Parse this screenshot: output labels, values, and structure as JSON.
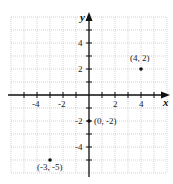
{
  "chart_data": {
    "type": "scatter",
    "title": "",
    "xlabel": "x",
    "ylabel": "y",
    "xlim": [
      -6,
      6
    ],
    "ylim": [
      -6,
      6
    ],
    "grid": true,
    "x_ticks": [
      -4,
      -2,
      2,
      4
    ],
    "y_ticks": [
      4,
      2,
      -2,
      -4
    ],
    "x_tick_labels": [
      "-4",
      "-2",
      "2",
      "4"
    ],
    "y_tick_labels": [
      "4",
      "2",
      "-2",
      "-4"
    ],
    "points": [
      {
        "x": 4,
        "y": 2,
        "label": "(4, 2)"
      },
      {
        "x": 0,
        "y": -2,
        "label": "(0, -2)"
      },
      {
        "x": -3,
        "y": -5,
        "label": "(-3, -5)"
      }
    ],
    "legend": null
  },
  "colors": {
    "axis": "#111111",
    "grid": "#b5b5b5",
    "point": "#111111"
  }
}
